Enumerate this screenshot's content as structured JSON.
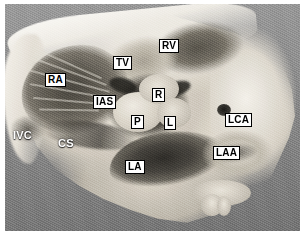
{
  "figure": {
    "kind": "anatomical-specimen-photograph",
    "modality": "grayscale photograph",
    "background_color": "#8d8d8d",
    "border_color": "#ffffff"
  },
  "labels": [
    {
      "id": "ra",
      "text": "RA",
      "meaning": "right atrium",
      "style": "boxed",
      "x": 40,
      "y": 69
    },
    {
      "id": "tv",
      "text": "TV",
      "meaning": "tricuspid valve",
      "style": "boxed",
      "x": 108,
      "y": 52
    },
    {
      "id": "rv",
      "text": "RV",
      "meaning": "right ventricle",
      "style": "boxed",
      "x": 154,
      "y": 35
    },
    {
      "id": "ias",
      "text": "IAS",
      "meaning": "interatrial septum",
      "style": "boxed",
      "x": 88,
      "y": 91
    },
    {
      "id": "r",
      "text": "R",
      "meaning": "right coronary aortic cusp",
      "style": "boxed",
      "x": 147,
      "y": 84
    },
    {
      "id": "p",
      "text": "P",
      "meaning": "posterior (non-coronary) aortic cusp",
      "style": "boxed",
      "x": 126,
      "y": 111
    },
    {
      "id": "l",
      "text": "L",
      "meaning": "left coronary aortic cusp",
      "style": "boxed",
      "x": 159,
      "y": 112
    },
    {
      "id": "lca",
      "text": "LCA",
      "meaning": "left coronary artery ostium",
      "style": "boxed",
      "x": 220,
      "y": 109
    },
    {
      "id": "laa",
      "text": "LAA",
      "meaning": "left atrial appendage",
      "style": "boxed",
      "x": 208,
      "y": 142
    },
    {
      "id": "la",
      "text": "LA",
      "meaning": "left atrium",
      "style": "boxed",
      "x": 120,
      "y": 156
    },
    {
      "id": "ivc",
      "text": "IVC",
      "meaning": "inferior vena cava",
      "style": "plain",
      "x": 8,
      "y": 126
    },
    {
      "id": "cs",
      "text": "CS",
      "meaning": "coronary sinus",
      "style": "plain",
      "x": 53,
      "y": 134
    }
  ]
}
